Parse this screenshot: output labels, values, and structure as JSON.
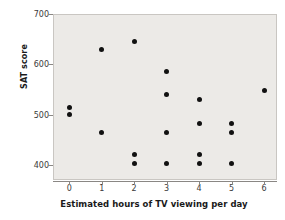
{
  "chart_data": {
    "type": "scatter",
    "title": "",
    "xlabel": "Estimated hours of TV viewing per day",
    "ylabel": "SAT score",
    "xlim": [
      -0.5,
      6.4
    ],
    "ylim": [
      370,
      700
    ],
    "grid": false,
    "legend": null,
    "xticks": [
      "0",
      "1",
      "2",
      "3",
      "4",
      "5",
      "6"
    ],
    "xtick_values": [
      0,
      1,
      2,
      3,
      4,
      5,
      6
    ],
    "yticks": [
      "700",
      "600",
      "500",
      "400"
    ],
    "ytick_values": [
      700,
      600,
      500,
      400
    ],
    "marker": {
      "shape": "circle",
      "color": "#111111",
      "size": 5
    },
    "plot_background": "#eceae7",
    "points": [
      {
        "x": 0,
        "y": 515
      },
      {
        "x": 0,
        "y": 500
      },
      {
        "x": 1,
        "y": 630
      },
      {
        "x": 1,
        "y": 465
      },
      {
        "x": 2,
        "y": 645
      },
      {
        "x": 2,
        "y": 420
      },
      {
        "x": 2,
        "y": 403
      },
      {
        "x": 3,
        "y": 585
      },
      {
        "x": 3,
        "y": 540
      },
      {
        "x": 3,
        "y": 465
      },
      {
        "x": 3,
        "y": 403
      },
      {
        "x": 4,
        "y": 530
      },
      {
        "x": 4,
        "y": 482
      },
      {
        "x": 4,
        "y": 420
      },
      {
        "x": 4,
        "y": 403
      },
      {
        "x": 5,
        "y": 482
      },
      {
        "x": 5,
        "y": 465
      },
      {
        "x": 5,
        "y": 403
      },
      {
        "x": 6,
        "y": 547
      }
    ]
  }
}
